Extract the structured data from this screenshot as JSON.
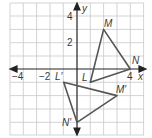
{
  "diagram": {
    "type": "coordinate-plane-transformation",
    "axes": {
      "x_label": "x",
      "y_label": "y",
      "x_ticks": [
        {
          "value": -4,
          "label": "−4"
        },
        {
          "value": -2,
          "label": "−2"
        },
        {
          "value": 4,
          "label": "4"
        }
      ],
      "y_ticks": [
        {
          "value": 4,
          "label": "4"
        },
        {
          "value": 2,
          "label": "2"
        }
      ],
      "x_range": [
        -5,
        5
      ],
      "y_range": [
        -5,
        5
      ]
    },
    "triangles": [
      {
        "name": "LMN",
        "vertices": [
          {
            "label": "L",
            "x": 1,
            "y": -1
          },
          {
            "label": "M",
            "x": 2,
            "y": 3
          },
          {
            "label": "N",
            "x": 4,
            "y": 0
          }
        ]
      },
      {
        "name": "L'M'N'",
        "vertices": [
          {
            "label": "L′",
            "x": -1,
            "y": -1
          },
          {
            "label": "M′",
            "x": 3,
            "y": -2
          },
          {
            "label": "N′",
            "x": 0,
            "y": -4
          }
        ]
      }
    ],
    "colors": {
      "grid": "#c8c8c8",
      "axis": "#222222",
      "triangle": "#555555",
      "text": "#3a3a3a"
    }
  }
}
